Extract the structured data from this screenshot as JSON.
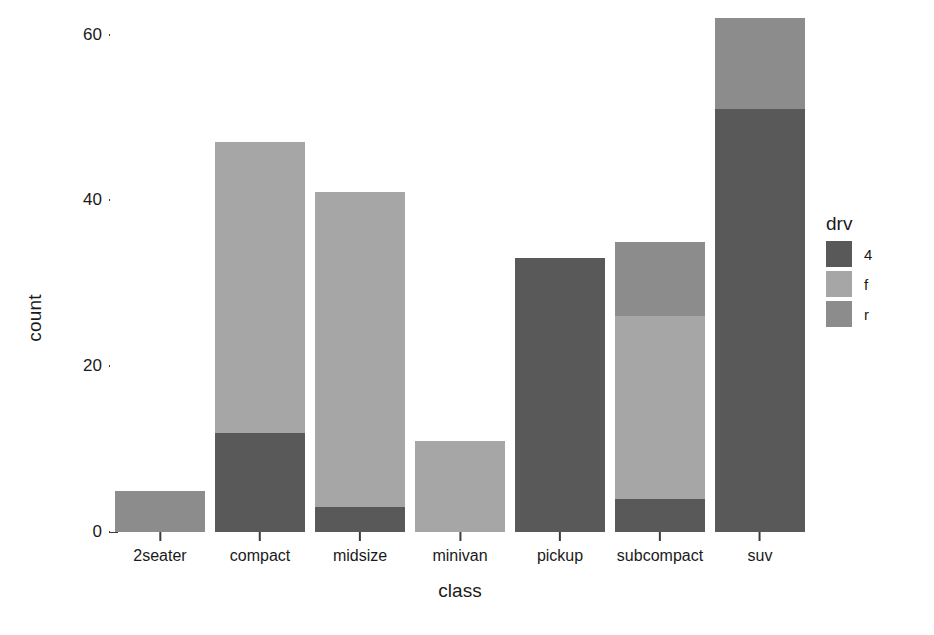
{
  "chart_data": {
    "type": "bar",
    "stacked": true,
    "title": "",
    "subtitle": "",
    "xlabel": "class",
    "ylabel": "count",
    "categories": [
      "2seater",
      "compact",
      "midsize",
      "minivan",
      "pickup",
      "subcompact",
      "suv"
    ],
    "series": [
      {
        "name": "4",
        "color": "#595959",
        "values": [
          0,
          12,
          3,
          0,
          33,
          4,
          51
        ]
      },
      {
        "name": "f",
        "color": "#a6a6a6",
        "values": [
          0,
          35,
          38,
          11,
          0,
          22,
          0
        ]
      },
      {
        "name": "r",
        "color": "#8c8c8c",
        "values": [
          5,
          0,
          0,
          0,
          0,
          9,
          11
        ]
      }
    ],
    "totals": [
      5,
      47,
      41,
      11,
      33,
      35,
      62
    ],
    "ylim": [
      0,
      62
    ],
    "yticks": [
      0,
      20,
      40,
      60
    ],
    "ytick_labels": [
      "0",
      "20",
      "40",
      "60"
    ],
    "grid": false,
    "legend": {
      "title": "drv",
      "position": "right",
      "entries": [
        {
          "label": "4",
          "color": "#595959"
        },
        {
          "label": "f",
          "color": "#a6a6a6"
        },
        {
          "label": "r",
          "color": "#8c8c8c"
        }
      ]
    },
    "background": "#ffffff",
    "axis_color": "#1a1a1a"
  }
}
